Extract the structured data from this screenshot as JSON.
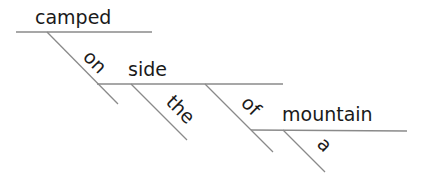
{
  "diagram": {
    "type": "sentence-diagram",
    "words": {
      "verb": "camped",
      "prep1": "on",
      "obj1": "side",
      "det1": "the",
      "prep2": "of",
      "obj2": "mountain",
      "det2": "a"
    },
    "colors": {
      "line": "#8a8a8a",
      "text": "#1a1a1a",
      "background": "#ffffff"
    }
  }
}
